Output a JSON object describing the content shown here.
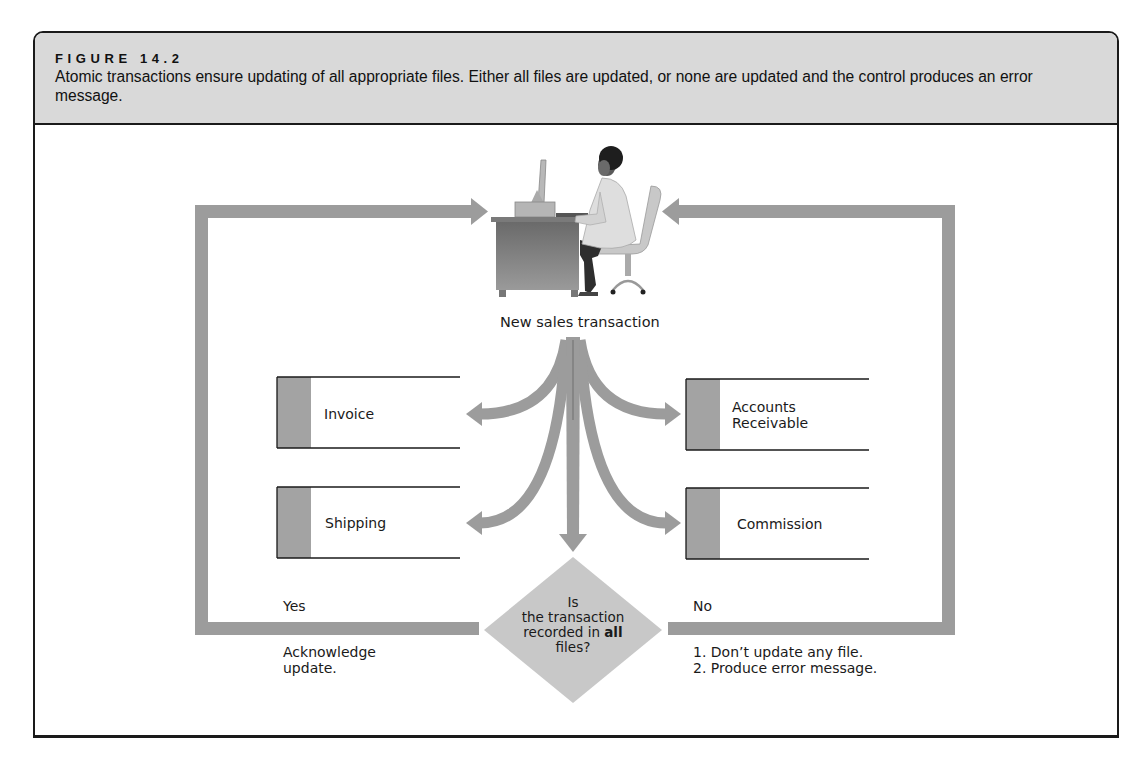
{
  "figure": {
    "label": "FIGURE 14.2",
    "caption": "Atomic transactions ensure updating of all appropriate files. Either all files are updated, or none are updated and the control produces an error message."
  },
  "diagram": {
    "source": {
      "icon": "person-at-computer-desk-icon",
      "label": "New sales transaction"
    },
    "files": [
      {
        "id": "invoice",
        "label": "Invoice",
        "side": "left"
      },
      {
        "id": "shipping",
        "label": "Shipping",
        "side": "left"
      },
      {
        "id": "accounts-receivable",
        "label_line1": "Accounts",
        "label_line2": "Receivable",
        "side": "right"
      },
      {
        "id": "commission",
        "label": "Commission",
        "side": "right"
      }
    ],
    "decision": {
      "line1": "Is",
      "line2": "the transaction",
      "line3_prefix": "recorded in ",
      "line3_bold": "all",
      "line4": "files?"
    },
    "yes_branch": {
      "label": "Yes",
      "action_line1": "Acknowledge",
      "action_line2": "update."
    },
    "no_branch": {
      "label": "No",
      "action_line1": "1. Don’t update any file.",
      "action_line2": "2. Produce error message."
    },
    "colors": {
      "arrow_gray": "#9c9c9c",
      "header_gray": "#d9d9d9",
      "diamond_gray": "#c8c8c8",
      "file_tab_gray": "#a3a3a3",
      "border": "#1a1a1a"
    }
  }
}
